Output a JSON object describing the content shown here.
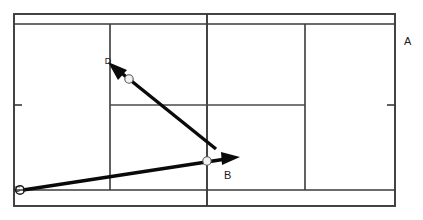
{
  "diagram": {
    "background_color": "#ffffff",
    "line_color": "#3a3a3a",
    "arrow_color": "#0a0a0a",
    "ball_color": "#f2f2f2"
  },
  "court": {
    "doubles": {
      "left": 14,
      "top": 14,
      "right": 395,
      "bottom": 206
    },
    "singles": {
      "top": 24,
      "bottom": 190
    },
    "net_x": 207,
    "service_line_left_x": 110,
    "service_line_right_x": 305,
    "center_service_y": 105,
    "center_mark_left": {
      "x": 14,
      "y": 105,
      "length": 8
    },
    "center_mark_right": {
      "x": 395,
      "y": 105,
      "length": 8
    }
  },
  "labels": {
    "a": {
      "text": "A",
      "x": 406,
      "y": 42
    },
    "b": {
      "text": "B",
      "x": 226,
      "y": 175
    },
    "c": {
      "text": "C",
      "x": 20,
      "y": 190
    },
    "d": {
      "text": "D",
      "x": 110,
      "y": 62
    }
  },
  "shots": [
    {
      "name": "shot-to-d",
      "from": {
        "x": 216,
        "y": 149
      },
      "to": {
        "x": 110,
        "y": 64
      },
      "ball": {
        "x": 129,
        "y": 79,
        "r": 4.2
      },
      "endpoint_label": "D"
    },
    {
      "name": "shot-to-b",
      "from": {
        "x": 23,
        "y": 190
      },
      "to": {
        "x": 238,
        "y": 157
      },
      "ball": {
        "x": 207,
        "y": 161,
        "r": 4.2
      },
      "endpoint_label": "B"
    }
  ]
}
